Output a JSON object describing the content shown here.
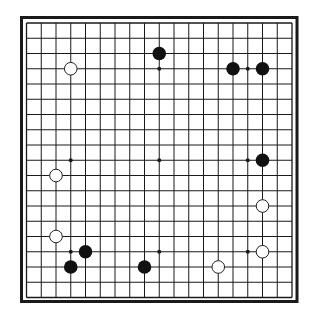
{
  "diagram": {
    "type": "go-board",
    "size": 19,
    "colors": {
      "background": "#ffffff",
      "line": "#1a1a1a",
      "border": "#1a1a1a",
      "black_stone": "#111111",
      "white_stone": "#ffffff",
      "white_stone_outline": "#222222"
    },
    "hoshi": [
      [
        3,
        3
      ],
      [
        9,
        3
      ],
      [
        15,
        3
      ],
      [
        3,
        9
      ],
      [
        9,
        9
      ],
      [
        15,
        9
      ],
      [
        3,
        15
      ],
      [
        9,
        15
      ],
      [
        15,
        15
      ]
    ],
    "stones": [
      {
        "color": "white",
        "col": 3,
        "row": 3
      },
      {
        "color": "black",
        "col": 9,
        "row": 2
      },
      {
        "color": "black",
        "col": 14,
        "row": 3
      },
      {
        "color": "black",
        "col": 16,
        "row": 3
      },
      {
        "color": "black",
        "col": 16,
        "row": 9
      },
      {
        "color": "white",
        "col": 2,
        "row": 10
      },
      {
        "color": "white",
        "col": 16,
        "row": 12
      },
      {
        "color": "white",
        "col": 2,
        "row": 14
      },
      {
        "color": "black",
        "col": 4,
        "row": 15
      },
      {
        "color": "white",
        "col": 16,
        "row": 15
      },
      {
        "color": "black",
        "col": 3,
        "row": 16
      },
      {
        "color": "black",
        "col": 8,
        "row": 16
      },
      {
        "color": "white",
        "col": 13,
        "row": 16
      }
    ]
  }
}
